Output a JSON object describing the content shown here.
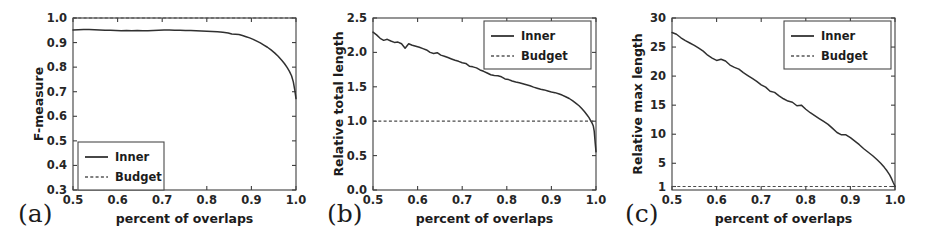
{
  "figure": {
    "panel_count": 3,
    "background": "#ffffff",
    "line_color": "#303030",
    "budget_color": "#4a4a4a"
  },
  "chart_data": [
    {
      "id": "a",
      "type": "line",
      "panel_label": "(a)",
      "title": "",
      "xlabel": "percent of overlaps",
      "ylabel": "F-measure",
      "xlim": [
        0.5,
        1.0
      ],
      "ylim": [
        0.3,
        1.0
      ],
      "xticks": [
        0.5,
        0.6,
        0.7,
        0.8,
        0.9,
        1.0
      ],
      "xticklabels": [
        "0.5",
        "0.6",
        "0.7",
        "0.8",
        "0.9",
        "1.0"
      ],
      "yticks": [
        0.3,
        0.4,
        0.5,
        0.6,
        0.7,
        0.8,
        0.9,
        1.0
      ],
      "yticklabels": [
        "0.3",
        "0.4",
        "0.5",
        "0.6",
        "0.7",
        "0.8",
        "0.9",
        "1.0"
      ],
      "grid": false,
      "legend_position": "lower left",
      "legend": [
        {
          "name": "Inner",
          "style": "solid"
        },
        {
          "name": "Budget",
          "style": "dashed"
        }
      ],
      "series": [
        {
          "name": "Inner",
          "style": "solid",
          "x": [
            0.5,
            0.512,
            0.524,
            0.536,
            0.548,
            0.56,
            0.572,
            0.584,
            0.596,
            0.608,
            0.62,
            0.632,
            0.644,
            0.656,
            0.668,
            0.68,
            0.692,
            0.704,
            0.716,
            0.728,
            0.74,
            0.752,
            0.764,
            0.776,
            0.788,
            0.8,
            0.812,
            0.824,
            0.836,
            0.848,
            0.856,
            0.864,
            0.872,
            0.88,
            0.888,
            0.896,
            0.904,
            0.912,
            0.92,
            0.928,
            0.936,
            0.944,
            0.952,
            0.96,
            0.968,
            0.974,
            0.98,
            0.985,
            0.99,
            0.994,
            0.997,
            1.0
          ],
          "y": [
            0.951,
            0.952,
            0.953,
            0.953,
            0.952,
            0.951,
            0.95,
            0.95,
            0.949,
            0.948,
            0.949,
            0.948,
            0.949,
            0.948,
            0.948,
            0.949,
            0.95,
            0.951,
            0.951,
            0.95,
            0.95,
            0.949,
            0.949,
            0.948,
            0.947,
            0.946,
            0.945,
            0.944,
            0.942,
            0.939,
            0.935,
            0.934,
            0.933,
            0.929,
            0.924,
            0.919,
            0.913,
            0.906,
            0.899,
            0.89,
            0.881,
            0.87,
            0.858,
            0.844,
            0.828,
            0.815,
            0.799,
            0.784,
            0.765,
            0.74,
            0.71,
            0.672
          ]
        },
        {
          "name": "Budget",
          "style": "dashed",
          "x": [
            0.5,
            1.0
          ],
          "y": [
            1.0,
            1.0
          ]
        }
      ]
    },
    {
      "id": "b",
      "type": "line",
      "panel_label": "(b)",
      "title": "",
      "xlabel": "percent of overlaps",
      "ylabel": "Relative total length",
      "xlim": [
        0.5,
        1.0
      ],
      "ylim": [
        0.0,
        2.5
      ],
      "xticks": [
        0.5,
        0.6,
        0.7,
        0.8,
        0.9,
        1.0
      ],
      "xticklabels": [
        "0.5",
        "0.6",
        "0.7",
        "0.8",
        "0.9",
        "1.0"
      ],
      "yticks": [
        0.0,
        0.5,
        1.0,
        1.5,
        2.0,
        2.5
      ],
      "yticklabels": [
        "0.0",
        "0.5",
        "1.0",
        "1.5",
        "2.0",
        "2.5"
      ],
      "grid": false,
      "legend_position": "upper right",
      "legend": [
        {
          "name": "Inner",
          "style": "solid"
        },
        {
          "name": "Budget",
          "style": "dashed"
        }
      ],
      "series": [
        {
          "name": "Inner",
          "style": "solid",
          "x": [
            0.5,
            0.508,
            0.516,
            0.524,
            0.532,
            0.54,
            0.548,
            0.556,
            0.564,
            0.572,
            0.58,
            0.588,
            0.596,
            0.604,
            0.612,
            0.62,
            0.628,
            0.636,
            0.644,
            0.652,
            0.66,
            0.668,
            0.676,
            0.684,
            0.692,
            0.7,
            0.708,
            0.716,
            0.724,
            0.732,
            0.74,
            0.748,
            0.756,
            0.764,
            0.772,
            0.78,
            0.788,
            0.796,
            0.804,
            0.812,
            0.82,
            0.828,
            0.836,
            0.844,
            0.852,
            0.86,
            0.868,
            0.876,
            0.884,
            0.892,
            0.9,
            0.908,
            0.916,
            0.924,
            0.932,
            0.94,
            0.948,
            0.956,
            0.962,
            0.968,
            0.974,
            0.98,
            0.984,
            0.988,
            0.991,
            0.994,
            0.996,
            0.998,
            1.0
          ],
          "y": [
            2.295,
            2.255,
            2.205,
            2.175,
            2.19,
            2.165,
            2.145,
            2.15,
            2.125,
            2.06,
            2.125,
            2.105,
            2.09,
            2.075,
            2.055,
            2.035,
            2.0,
            1.985,
            1.995,
            1.96,
            1.945,
            1.925,
            1.905,
            1.885,
            1.87,
            1.85,
            1.84,
            1.8,
            1.79,
            1.775,
            1.745,
            1.725,
            1.7,
            1.675,
            1.665,
            1.66,
            1.645,
            1.615,
            1.605,
            1.585,
            1.57,
            1.56,
            1.545,
            1.53,
            1.515,
            1.495,
            1.48,
            1.465,
            1.455,
            1.44,
            1.425,
            1.415,
            1.4,
            1.38,
            1.355,
            1.33,
            1.295,
            1.255,
            1.225,
            1.185,
            1.14,
            1.09,
            1.055,
            1.01,
            0.975,
            0.93,
            0.855,
            0.7,
            0.555
          ]
        },
        {
          "name": "Budget",
          "style": "dashed",
          "x": [
            0.5,
            1.0
          ],
          "y": [
            1.0,
            1.0
          ]
        }
      ]
    },
    {
      "id": "c",
      "type": "line",
      "panel_label": "(c)",
      "title": "",
      "xlabel": "percent of overlaps",
      "ylabel": "Relative max length",
      "xlim": [
        0.5,
        1.0
      ],
      "ylim": [
        0.4,
        30.0
      ],
      "xticks": [
        0.5,
        0.6,
        0.7,
        0.8,
        0.9,
        1.0
      ],
      "xticklabels": [
        "0.5",
        "0.6",
        "0.7",
        "0.8",
        "0.9",
        "1.0"
      ],
      "yticks": [
        1,
        5,
        10,
        15,
        20,
        25,
        30
      ],
      "yticklabels": [
        "1",
        "5",
        "10",
        "15",
        "20",
        "25",
        "30"
      ],
      "grid": false,
      "legend_position": "upper right",
      "legend": [
        {
          "name": "Inner",
          "style": "solid"
        },
        {
          "name": "Budget",
          "style": "dashed"
        }
      ],
      "series": [
        {
          "name": "Inner",
          "style": "solid",
          "x": [
            0.5,
            0.51,
            0.52,
            0.53,
            0.54,
            0.55,
            0.56,
            0.57,
            0.58,
            0.59,
            0.6,
            0.61,
            0.62,
            0.63,
            0.64,
            0.65,
            0.66,
            0.67,
            0.68,
            0.69,
            0.7,
            0.71,
            0.72,
            0.73,
            0.74,
            0.75,
            0.76,
            0.77,
            0.78,
            0.79,
            0.8,
            0.81,
            0.82,
            0.83,
            0.84,
            0.85,
            0.86,
            0.87,
            0.88,
            0.89,
            0.9,
            0.91,
            0.92,
            0.93,
            0.94,
            0.95,
            0.96,
            0.968,
            0.976,
            0.982,
            0.988,
            0.992,
            0.996,
            1.0
          ],
          "y": [
            27.5,
            27.2,
            26.6,
            26.1,
            25.7,
            25.3,
            24.8,
            24.3,
            23.6,
            23.1,
            22.7,
            22.9,
            22.6,
            21.9,
            21.5,
            21.2,
            20.6,
            20.1,
            19.6,
            19.1,
            18.5,
            18.1,
            17.4,
            17.2,
            16.6,
            16.1,
            15.7,
            15.5,
            14.9,
            15.0,
            14.3,
            13.7,
            13.2,
            12.7,
            12.2,
            11.7,
            11.0,
            10.3,
            9.9,
            9.9,
            9.4,
            8.8,
            8.2,
            7.5,
            6.9,
            6.3,
            5.6,
            5.0,
            4.3,
            3.7,
            3.0,
            2.4,
            1.7,
            1.05
          ]
        },
        {
          "name": "Budget",
          "style": "dashed",
          "x": [
            0.5,
            1.0
          ],
          "y": [
            1.0,
            1.0
          ]
        }
      ]
    }
  ]
}
